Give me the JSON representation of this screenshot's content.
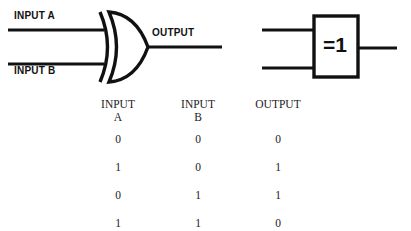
{
  "diagram": {
    "title_text": "",
    "gate_type": "XOR",
    "distinctive_shape": {
      "name": "xor-gate-distinctive-shape",
      "input_a_label": "INPUT A",
      "input_b_label": "INPUT B",
      "output_label": "OUTPUT"
    },
    "rectangular_shape": {
      "name": "xor-gate-iec-rectangular-shape",
      "body_label": "=1"
    },
    "line_color": "#111111",
    "background_color": "#ffffff"
  },
  "truth_table": {
    "headers": [
      {
        "top": "INPUT",
        "sub": "A"
      },
      {
        "top": "INPUT",
        "sub": "B"
      },
      {
        "top": "OUTPUT",
        "sub": ""
      }
    ],
    "rows": [
      {
        "a": "0",
        "b": "0",
        "out": "0"
      },
      {
        "a": "1",
        "b": "0",
        "out": "1"
      },
      {
        "a": "0",
        "b": "1",
        "out": "1"
      },
      {
        "a": "1",
        "b": "1",
        "out": "0"
      }
    ]
  }
}
